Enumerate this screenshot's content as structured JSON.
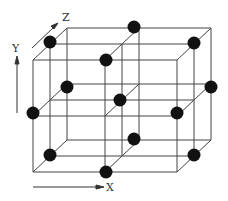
{
  "diagram": {
    "axes": {
      "x": "X",
      "y": "Y",
      "z": "Z"
    },
    "line_color": "#444444",
    "dot_color": "#111111",
    "front_face": {
      "left": 33,
      "right": 177,
      "top": 60,
      "bottom": 172
    },
    "depth_offset": {
      "dx": 34,
      "dy": -32
    },
    "atoms": [
      {
        "x": 50,
        "y": 42
      },
      {
        "x": 134,
        "y": 27
      },
      {
        "x": 194,
        "y": 43
      },
      {
        "x": 106,
        "y": 60
      },
      {
        "x": 67,
        "y": 87
      },
      {
        "x": 33,
        "y": 113
      },
      {
        "x": 120,
        "y": 100
      },
      {
        "x": 177,
        "y": 113
      },
      {
        "x": 211,
        "y": 87
      },
      {
        "x": 134,
        "y": 139
      },
      {
        "x": 50,
        "y": 155
      },
      {
        "x": 106,
        "y": 172
      },
      {
        "x": 194,
        "y": 155
      }
    ]
  }
}
